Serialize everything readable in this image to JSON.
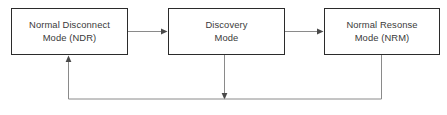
{
  "diagram": {
    "canvas": {
      "width": 447,
      "height": 115,
      "background": "#ffffff"
    },
    "style": {
      "box_border_color": "#2b2b2b",
      "box_fill_color": "#ffffff",
      "connector_color": "#8a8a8a",
      "arrowhead_color": "#4a4a4a",
      "text_color": "#3a3a3a"
    },
    "nodes": [
      {
        "id": "ndr",
        "label": "Normal Disconnect\nMode (NDR)",
        "line1": "Normal Disconnect",
        "line2": "Mode (NDR)",
        "x": 11,
        "y": 8,
        "width": 117,
        "height": 47
      },
      {
        "id": "discovery",
        "label": "Discovery\nMode",
        "line1": "Discovery",
        "line2": "Mode",
        "x": 168,
        "y": 8,
        "width": 117,
        "height": 47
      },
      {
        "id": "nrm",
        "label": "Normal Resonse\nMode (NRM)",
        "line1": "Normal Resonse",
        "line2": "Mode (NRM)",
        "x": 324,
        "y": 8,
        "width": 116,
        "height": 47
      }
    ],
    "edges": [
      {
        "id": "ndr-to-discovery",
        "from": "ndr",
        "to": "discovery",
        "direction": "right",
        "label": ""
      },
      {
        "id": "discovery-to-nrm",
        "from": "discovery",
        "to": "nrm",
        "direction": "right",
        "label": ""
      },
      {
        "id": "discovery-to-return-bus",
        "from": "discovery",
        "to": "return-bus",
        "direction": "down",
        "label": ""
      },
      {
        "id": "nrm-to-ndr-feedback",
        "from": "nrm",
        "to": "ndr",
        "direction": "up-left",
        "label": ""
      }
    ]
  }
}
